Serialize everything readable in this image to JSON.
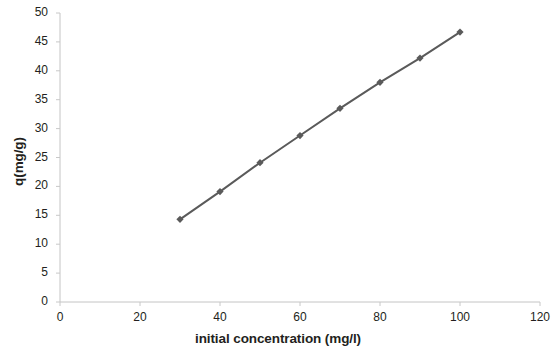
{
  "chart_data": {
    "type": "line",
    "title": "",
    "subtitle": "",
    "xlabel": "initial concentration (mg/l)",
    "ylabel": "q(mg/g)",
    "xlim": [
      0,
      120
    ],
    "ylim": [
      0,
      50
    ],
    "xticks": [
      0,
      20,
      40,
      60,
      80,
      100,
      120
    ],
    "yticks": [
      0,
      5,
      10,
      15,
      20,
      25,
      30,
      35,
      40,
      45,
      50
    ],
    "xtick_labels": [
      "0",
      "20",
      "40",
      "60",
      "80",
      "100",
      "120"
    ],
    "ytick_labels": [
      "0",
      "5",
      "10",
      "15",
      "20",
      "25",
      "30",
      "35",
      "40",
      "45",
      "50"
    ],
    "grid": false,
    "legend": false,
    "legend_position": "none",
    "marker": "diamond",
    "series": [
      {
        "name": "q",
        "color": "#5a5a5a",
        "x": [
          30,
          40,
          50,
          60,
          70,
          80,
          90,
          100
        ],
        "values": [
          14.3,
          19.1,
          24.1,
          28.8,
          33.5,
          38.0,
          42.2,
          46.7
        ],
        "points": [
          {
            "x": 30,
            "y": 14.3
          },
          {
            "x": 40,
            "y": 19.1
          },
          {
            "x": 50,
            "y": 24.1
          },
          {
            "x": 60,
            "y": 28.8
          },
          {
            "x": 70,
            "y": 33.5
          },
          {
            "x": 80,
            "y": 38.0
          },
          {
            "x": 90,
            "y": 42.2
          },
          {
            "x": 100,
            "y": 46.7
          }
        ]
      }
    ],
    "annotations": []
  },
  "colors": {
    "series": "#5a5a5a",
    "axis": "#bfbfbf",
    "tick_mark": "#c8c8c8",
    "text": "#231f20",
    "background": "#ffffff"
  },
  "axes": {
    "x_title": "initial concentration (mg/l)",
    "y_title": "q(mg/g)"
  }
}
